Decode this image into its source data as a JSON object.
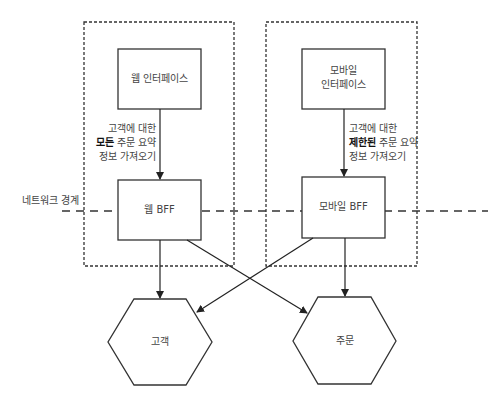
{
  "diagram": {
    "network_boundary_label": "네트워크 경계",
    "web_interface": {
      "label": "웹 인터페이스"
    },
    "mobile_interface": {
      "line1": "모바일",
      "line2": "인터페이스"
    },
    "web_bff": {
      "label": "웹 BFF"
    },
    "mobile_bff": {
      "label": "모바일 BFF"
    },
    "customer_service": {
      "label": "고객"
    },
    "order_service": {
      "label": "주문"
    },
    "web_note": {
      "line1": "고객에 대한",
      "line2_bold": "모든",
      "line2_rest": " 주문 요약",
      "line3": "정보 가져오기"
    },
    "mobile_note": {
      "line1": "고객에 대한",
      "line2_bold": "제한된",
      "line2_rest": " 주문 요약",
      "line3": "정보 가져오기"
    },
    "colors": {
      "stroke": "#333333",
      "text": "#444444",
      "background": "#ffffff"
    }
  }
}
